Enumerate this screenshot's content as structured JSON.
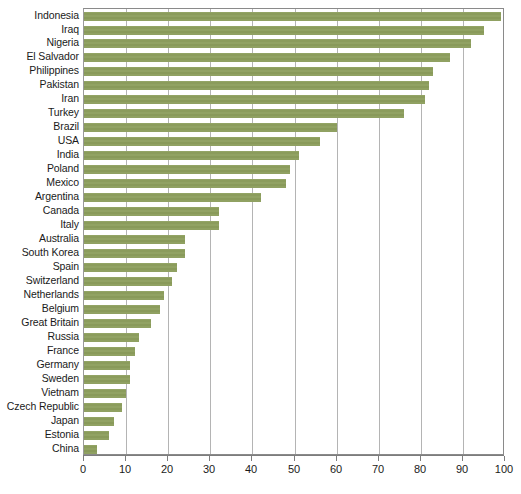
{
  "chart_data": {
    "type": "bar",
    "orientation": "horizontal",
    "title": "",
    "subtitle": "",
    "xlabel": "",
    "ylabel": "",
    "xlim": [
      0,
      100
    ],
    "xticks": [
      0,
      10,
      20,
      30,
      40,
      50,
      60,
      70,
      80,
      90,
      100
    ],
    "grid": "vertical",
    "legend": "none",
    "bar_color": "#8d9e5e",
    "categories": [
      "Indonesia",
      "Iraq",
      "Nigeria",
      "El Salvador",
      "Philippines",
      "Pakistan",
      "Iran",
      "Turkey",
      "Brazil",
      "USA",
      "India",
      "Poland",
      "Mexico",
      "Argentina",
      "Canada",
      "Italy",
      "Australia",
      "South Korea",
      "Spain",
      "Switzerland",
      "Netherlands",
      "Belgium",
      "Great Britain",
      "Russia",
      "France",
      "Germany",
      "Sweden",
      "Vietnam",
      "Czech Republic",
      "Japan",
      "Estonia",
      "China"
    ],
    "values": [
      99,
      95,
      92,
      87,
      83,
      82,
      81,
      76,
      60,
      56,
      51,
      49,
      48,
      42,
      32,
      32,
      24,
      24,
      22,
      21,
      19,
      18,
      16,
      13,
      12,
      11,
      11,
      10,
      9,
      7,
      6,
      3
    ]
  }
}
